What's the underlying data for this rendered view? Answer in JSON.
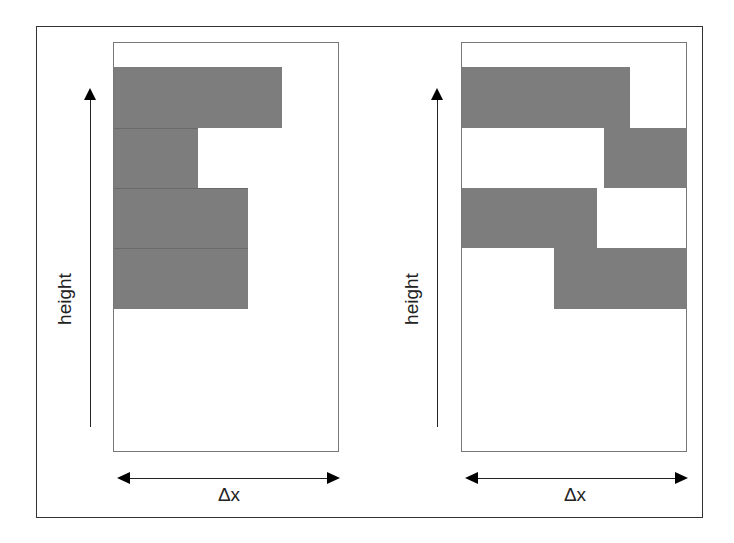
{
  "figure": {
    "panels": [
      {
        "id": "left",
        "y_axis_label": "height",
        "x_axis_label": "Δx",
        "bars": [
          {
            "x_start": 0,
            "x_end": 168,
            "row": 0
          },
          {
            "x_start": 0,
            "x_end": 84,
            "row": 1
          },
          {
            "x_start": 0,
            "x_end": 134,
            "row": 2
          },
          {
            "x_start": 0,
            "x_end": 134,
            "row": 3
          }
        ]
      },
      {
        "id": "right",
        "y_axis_label": "height",
        "x_axis_label": "Δx",
        "bars": [
          {
            "x_start": 0,
            "x_end": 168,
            "row": 0
          },
          {
            "x_start": 142,
            "x_end": 226,
            "row": 1
          },
          {
            "x_start": 0,
            "x_end": 135,
            "row": 2
          },
          {
            "x_start": 92,
            "x_end": 226,
            "row": 3
          }
        ]
      }
    ],
    "colors": {
      "bar_fill": "#7d7d7d",
      "frame": "#333333",
      "panel_border": "#777777",
      "arrow": "#000000"
    }
  }
}
